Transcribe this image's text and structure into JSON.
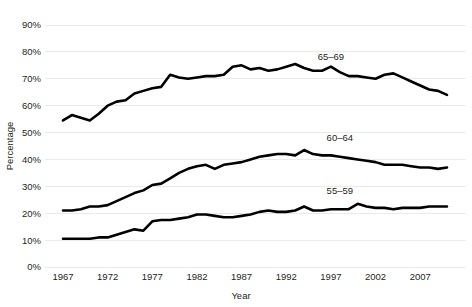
{
  "chart_data": {
    "type": "line",
    "title": "",
    "xlabel": "Year",
    "ylabel": "Percentage",
    "xlim": [
      1967,
      2010
    ],
    "ylim": [
      0,
      90
    ],
    "grid": true,
    "legend_position": "inline-annotation",
    "x_ticks": [
      "1967",
      "1972",
      "1977",
      "1982",
      "1987",
      "1992",
      "1997",
      "2002",
      "2007"
    ],
    "x_tick_values": [
      1967,
      1972,
      1977,
      1982,
      1987,
      1992,
      1997,
      2002,
      2007
    ],
    "y_ticks": [
      "0%",
      "10%",
      "20%",
      "30%",
      "40%",
      "50%",
      "60%",
      "70%",
      "80%",
      "90%"
    ],
    "y_tick_values": [
      0,
      10,
      20,
      30,
      40,
      50,
      60,
      70,
      80,
      90
    ],
    "x": [
      1967,
      1968,
      1969,
      1970,
      1971,
      1972,
      1973,
      1974,
      1975,
      1976,
      1977,
      1978,
      1979,
      1980,
      1981,
      1982,
      1983,
      1984,
      1985,
      1986,
      1987,
      1988,
      1989,
      1990,
      1991,
      1992,
      1993,
      1994,
      1995,
      1996,
      1997,
      1998,
      1999,
      2000,
      2001,
      2002,
      2003,
      2004,
      2005,
      2006,
      2007,
      2008,
      2009,
      2010
    ],
    "series": [
      {
        "name": "65–69",
        "label": "65–69",
        "color": "#000000",
        "annotation_x": 1997,
        "annotation_y": 77,
        "values": [
          54.5,
          56.5,
          55.5,
          54.5,
          57.0,
          60.0,
          61.5,
          62.0,
          64.5,
          65.5,
          66.5,
          67.0,
          71.5,
          70.5,
          70.0,
          70.5,
          71.0,
          71.0,
          71.5,
          74.5,
          75.0,
          73.5,
          74.0,
          73.0,
          73.5,
          74.5,
          75.5,
          74.0,
          73.0,
          73.0,
          74.5,
          72.5,
          71.0,
          71.0,
          70.5,
          70.0,
          71.5,
          72.0,
          70.5,
          69.0,
          67.5,
          66.0,
          65.5,
          64.0
        ]
      },
      {
        "name": "60–64",
        "label": "60–64",
        "color": "#000000",
        "annotation_x": 1998,
        "annotation_y": 47,
        "values": [
          21.0,
          21.0,
          21.5,
          22.5,
          22.5,
          23.0,
          24.5,
          26.0,
          27.5,
          28.5,
          30.5,
          31.0,
          33.0,
          35.0,
          36.5,
          37.5,
          38.0,
          36.5,
          38.0,
          38.5,
          39.0,
          40.0,
          41.0,
          41.5,
          42.0,
          42.0,
          41.5,
          43.5,
          42.0,
          41.5,
          41.5,
          41.0,
          40.5,
          40.0,
          39.5,
          39.0,
          38.0,
          38.0,
          38.0,
          37.5,
          37.0,
          37.0,
          36.5,
          37.0
        ]
      },
      {
        "name": "55–59",
        "label": "55–59",
        "color": "#000000",
        "annotation_x": 1998,
        "annotation_y": 27,
        "values": [
          10.5,
          10.5,
          10.5,
          10.5,
          11.0,
          11.0,
          12.0,
          13.0,
          14.0,
          13.5,
          17.0,
          17.5,
          17.5,
          18.0,
          18.5,
          19.5,
          19.5,
          19.0,
          18.5,
          18.5,
          19.0,
          19.5,
          20.5,
          21.0,
          20.5,
          20.5,
          21.0,
          22.5,
          21.0,
          21.0,
          21.5,
          21.5,
          21.5,
          23.5,
          22.5,
          22.0,
          22.0,
          21.5,
          22.0,
          22.0,
          22.0,
          22.5,
          22.5,
          22.5
        ]
      }
    ]
  }
}
